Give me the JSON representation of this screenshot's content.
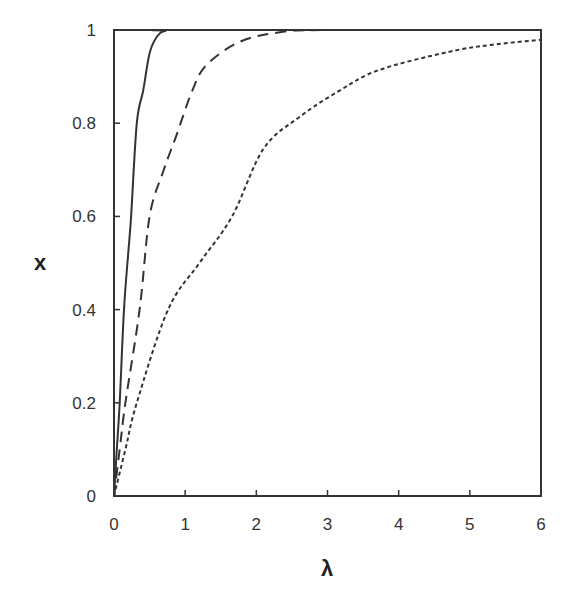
{
  "chart_data": {
    "type": "line",
    "title": "",
    "xlabel": "λ",
    "ylabel": "x",
    "xlim": [
      0,
      6
    ],
    "ylim": [
      0,
      1
    ],
    "xticks": [
      0,
      1,
      2,
      3,
      4,
      5,
      6
    ],
    "xtick_labels": [
      "0",
      "1",
      "2",
      "3",
      "4",
      "5",
      "6"
    ],
    "yticks": [
      0,
      0.2,
      0.4,
      0.6,
      0.8,
      1
    ],
    "ytick_labels": [
      "0",
      "0.2",
      "0.4",
      "0.6",
      "0.8",
      "1"
    ],
    "grid": false,
    "legend": null,
    "series": [
      {
        "name": "solid",
        "style": "solid",
        "x": [
          0,
          0.04,
          0.08,
          0.14,
          0.2,
          0.24,
          0.32,
          0.41,
          0.5,
          0.6,
          0.72,
          1.0,
          6.0
        ],
        "y": [
          0,
          0.1,
          0.2,
          0.4,
          0.52,
          0.6,
          0.8,
          0.87,
          0.95,
          0.985,
          0.998,
          1.0,
          1.0
        ]
      },
      {
        "name": "dashed",
        "style": "dashed",
        "x": [
          0,
          0.08,
          0.16,
          0.36,
          0.5,
          0.7,
          0.88,
          1.1,
          1.3,
          1.77,
          2.33,
          3.0,
          6.0
        ],
        "y": [
          0,
          0.1,
          0.2,
          0.4,
          0.6,
          0.7,
          0.775,
          0.87,
          0.925,
          0.975,
          0.995,
          1.0,
          1.0
        ]
      },
      {
        "name": "dotted",
        "style": "dotted",
        "x": [
          0,
          0.16,
          0.32,
          0.76,
          1.2,
          1.66,
          2.1,
          2.62,
          3.17,
          3.72,
          4.7,
          5.3,
          6.0
        ],
        "y": [
          0,
          0.1,
          0.2,
          0.4,
          0.5,
          0.6,
          0.745,
          0.815,
          0.87,
          0.914,
          0.953,
          0.968,
          0.979
        ]
      }
    ]
  }
}
